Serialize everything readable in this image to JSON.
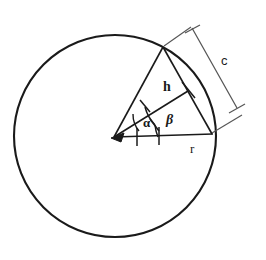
{
  "figure": {
    "background_color": "#ffffff",
    "stroke_color": "#1a1a1a",
    "labels": {
      "chord_dimension": "c",
      "apothem": "h",
      "radius": "r",
      "angle_alpha": "α",
      "angle_beta": "β"
    },
    "geometry": {
      "circle": {
        "cx": 115,
        "cy": 136,
        "r": 101
      },
      "center_point": {
        "x": 114,
        "y": 137
      },
      "chord_top_point": {
        "x": 163,
        "y": 47
      },
      "chord_bottom_point": {
        "x": 212,
        "y": 134
      },
      "apothem_foot": {
        "x": 188,
        "y": 91
      },
      "dimension_line": {
        "x1": 192,
        "y1": 28,
        "x2": 237,
        "y2": 108
      },
      "angle_alpha_degrees": 31,
      "angle_beta_degrees": 30
    }
  }
}
